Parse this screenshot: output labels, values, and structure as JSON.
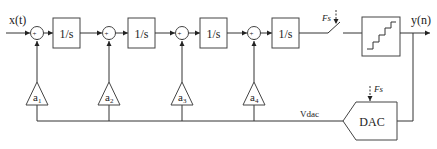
{
  "diagram": {
    "input_label": "x(t)",
    "output_label": "y(n)",
    "integrators": [
      {
        "label": "1/s"
      },
      {
        "label": "1/s"
      },
      {
        "label": "1/s"
      },
      {
        "label": "1/s"
      }
    ],
    "summers": [
      {
        "plus": "+",
        "minus": "-"
      },
      {
        "plus": "+",
        "minus": "-"
      },
      {
        "plus": "+",
        "minus": "-"
      },
      {
        "plus": "+",
        "minus": "-"
      }
    ],
    "gains": [
      {
        "base": "a",
        "sub": "1"
      },
      {
        "base": "a",
        "sub": "2"
      },
      {
        "base": "a",
        "sub": "3"
      },
      {
        "base": "a",
        "sub": "4"
      }
    ],
    "sampler_clock_label": "Fs",
    "quantizer_label": "",
    "dac_label": "DAC",
    "dac_clock_label": "Fs",
    "feedback_label": "Vdac"
  }
}
